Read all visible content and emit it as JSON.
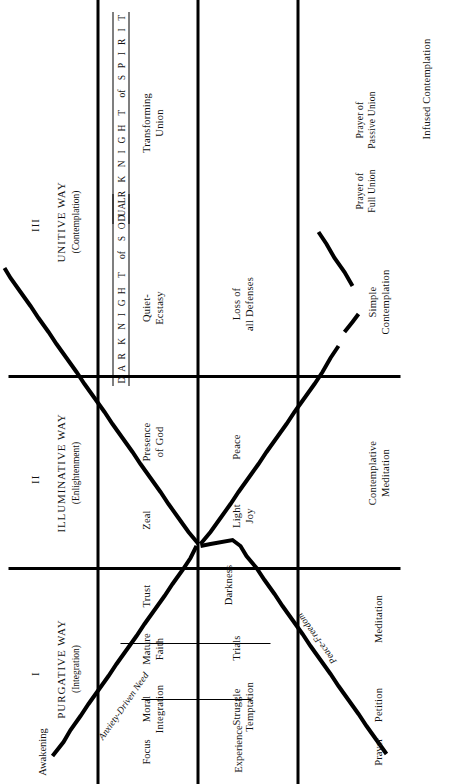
{
  "diagram": {
    "stages": [
      {
        "numeral": "I",
        "name": "PURGATIVE WAY",
        "subtitle": "(Integration)"
      },
      {
        "numeral": "II",
        "name": "ILLUMINATIVE WAY",
        "subtitle": "(Enlightenment)"
      },
      {
        "numeral": "III",
        "name": "UNITIVE WAY",
        "subtitle": "(Contemplation)"
      }
    ],
    "row_labels": [
      {
        "key": "awakening",
        "label": "Awakening"
      },
      {
        "key": "focus",
        "label": "Focus"
      },
      {
        "key": "experience",
        "label": "Experience"
      },
      {
        "key": "prayer",
        "label": "Prayer"
      }
    ],
    "focus_row": [
      {
        "label": "Moral\nIntegration",
        "stage": "I"
      },
      {
        "label": "Mature\nFaith",
        "stage": "I"
      },
      {
        "label": "Trust",
        "stage": "I"
      },
      {
        "label": "Zeal",
        "stage": "II"
      },
      {
        "label": "Presence\nof God",
        "stage": "II"
      },
      {
        "label": "Quiet-\nEcstasy",
        "stage": "III"
      },
      {
        "label": "Transforming\nUnion",
        "stage": "III"
      }
    ],
    "experience_row": [
      {
        "label": "Struggle\nTemptation",
        "stage": "I"
      },
      {
        "label": "Trials",
        "stage": "I"
      },
      {
        "label": "Darkness",
        "stage": "I"
      },
      {
        "label": "Light\nJoy",
        "stage": "II"
      },
      {
        "label": "Peace",
        "stage": "II"
      },
      {
        "label": "Loss of\nall Defenses",
        "stage": "III"
      }
    ],
    "prayer_row": [
      {
        "label": "Petition",
        "stage": "I"
      },
      {
        "label": "Meditation",
        "stage": "I"
      },
      {
        "label": "Contemplative\nMeditation",
        "stage": "II"
      },
      {
        "label": "Simple\nContemplation",
        "stage": "III"
      },
      {
        "label": "Prayer of\nFull Union",
        "stage": "III"
      },
      {
        "label": "Prayer of\nPassive Union",
        "stage": "III"
      },
      {
        "label": "Infused Contemplation",
        "stage": "III"
      }
    ],
    "arm_labels": [
      {
        "label": "Anxiety-Driven Need",
        "arm": "upper-left"
      },
      {
        "label": "Peace-Freedom",
        "arm": "lower-left"
      }
    ],
    "dark_night_bands": [
      {
        "key": "dark-night-of-soul",
        "letters": [
          "D",
          "A",
          "R",
          "K",
          "N",
          "I",
          "G",
          "H",
          "T"
        ],
        "connector": "of",
        "tail_letters": [
          "S",
          "O",
          "U",
          "L"
        ],
        "plain": "DARK NIGHT of SOUL"
      },
      {
        "key": "dark-night-of-spirit",
        "letters": [
          "D",
          "A",
          "R",
          "K",
          "N",
          "I",
          "G",
          "H",
          "T"
        ],
        "connector": "of",
        "tail_letters": [
          "S",
          "P",
          "I",
          "R",
          "I",
          "T"
        ],
        "plain": "DARK NIGHT of SPIRIT"
      }
    ],
    "colors": {
      "ink": "#000000",
      "paper": "#ffffff"
    }
  }
}
